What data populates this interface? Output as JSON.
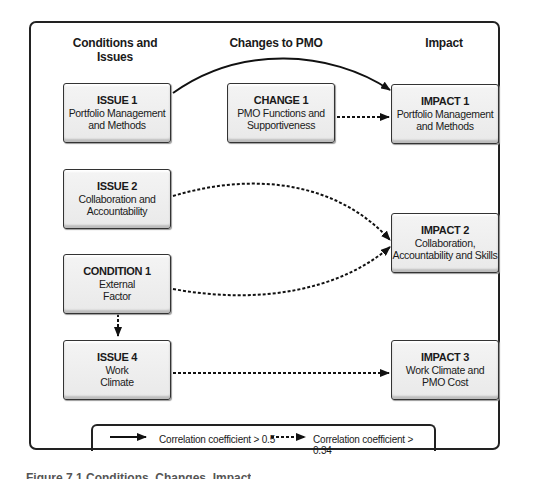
{
  "columns": {
    "left": "Conditions and Issues",
    "middle": "Changes to PMO",
    "right": "Impact"
  },
  "nodes": {
    "issue1": {
      "title": "ISSUE 1",
      "line1": "Portfolio Management",
      "line2": "and Methods"
    },
    "issue2": {
      "title": "ISSUE 2",
      "line1": "Collaboration and",
      "line2": "Accountability"
    },
    "condition1": {
      "title": "CONDITION 1",
      "line1": "External",
      "line2": "Factor"
    },
    "issue4": {
      "title": "ISSUE 4",
      "line1": "Work",
      "line2": "Climate"
    },
    "change1": {
      "title": "CHANGE 1",
      "line1": "PMO Functions and",
      "line2": "Supportiveness"
    },
    "impact1": {
      "title": "IMPACT 1",
      "line1": "Portfolio Management",
      "line2": "and Methods"
    },
    "impact2": {
      "title": "IMPACT 2",
      "line1": "Collaboration,",
      "line2": "Accountability and Skills"
    },
    "impact3": {
      "title": "IMPACT 3",
      "line1": "Work Climate and",
      "line2": "PMO Cost"
    }
  },
  "edges": [
    {
      "from": "ISSUE 1",
      "to": "IMPACT 1",
      "style": "solid"
    },
    {
      "from": "CHANGE 1",
      "to": "IMPACT 1",
      "style": "dotted"
    },
    {
      "from": "ISSUE 2",
      "to": "IMPACT 2",
      "style": "dotted"
    },
    {
      "from": "CONDITION 1",
      "to": "IMPACT 2",
      "style": "dotted"
    },
    {
      "from": "CONDITION 1",
      "to": "ISSUE 4",
      "style": "dotted"
    },
    {
      "from": "ISSUE 4",
      "to": "IMPACT 3",
      "style": "dotted"
    }
  ],
  "legend": {
    "solid": "Correlation coefficient > 0.5",
    "dotted": "Correlation coefficient > 0.34"
  },
  "caption": "Figure 7.1  Conditions, Changes, Impact"
}
